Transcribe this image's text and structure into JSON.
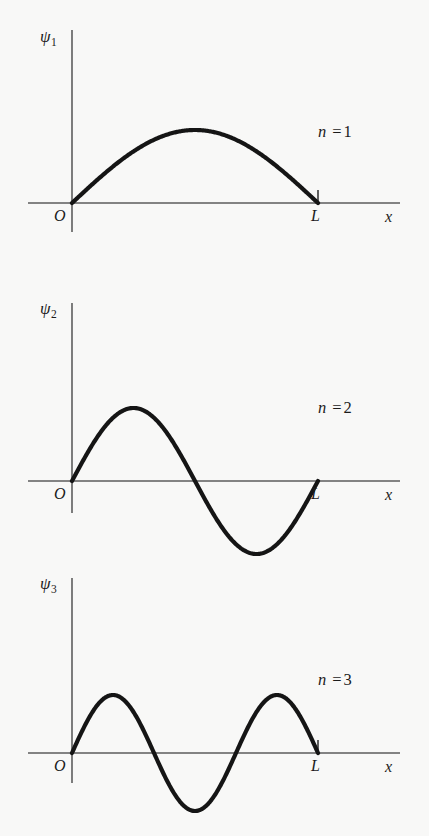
{
  "figure": {
    "background_color": "#f8f8f7",
    "curve_color": "#151515",
    "axis_color": "#5d5d5d",
    "axis_label_x": "x",
    "origin_label": "O",
    "end_label": "L"
  },
  "panels": [
    {
      "id": "panel-n1",
      "psi_symbol": "ψ",
      "psi_subscript": "1",
      "mode_var": "n",
      "mode_eq": "=",
      "mode_value": "1",
      "origin_label": "O",
      "end_label": "L",
      "axis_label_x": "x",
      "has_end_tick": true
    },
    {
      "id": "panel-n2",
      "psi_symbol": "ψ",
      "psi_subscript": "2",
      "mode_var": "n",
      "mode_eq": "=",
      "mode_value": "2",
      "origin_label": "O",
      "end_label": "L",
      "axis_label_x": "x",
      "has_end_tick": false
    },
    {
      "id": "panel-n3",
      "psi_symbol": "ψ",
      "psi_subscript": "3",
      "mode_var": "n",
      "mode_eq": "=",
      "mode_value": "3",
      "origin_label": "O",
      "end_label": "L",
      "axis_label_x": "x",
      "has_end_tick": true
    }
  ],
  "chart_data": [
    {
      "type": "line",
      "title": "",
      "xlabel": "x",
      "ylabel": "ψ₁",
      "annotation": "n = 1",
      "quantum_number": 1,
      "function": "sin(n*pi*x/L)",
      "x_domain": [
        0,
        1
      ],
      "x_tick_labels": [
        "O",
        "L"
      ],
      "ylim": [
        -1,
        1
      ],
      "grid": false,
      "legend": "none",
      "x": [
        0,
        0.05,
        0.1,
        0.15,
        0.2,
        0.25,
        0.3,
        0.35,
        0.4,
        0.45,
        0.5,
        0.55,
        0.6,
        0.65,
        0.7,
        0.75,
        0.8,
        0.85,
        0.9,
        0.95,
        1
      ],
      "y": [
        0,
        0.156,
        0.309,
        0.454,
        0.588,
        0.707,
        0.809,
        0.891,
        0.951,
        0.988,
        1,
        0.988,
        0.951,
        0.891,
        0.809,
        0.707,
        0.588,
        0.454,
        0.309,
        0.156,
        0
      ]
    },
    {
      "type": "line",
      "title": "",
      "xlabel": "x",
      "ylabel": "ψ₂",
      "annotation": "n = 2",
      "quantum_number": 2,
      "function": "sin(n*pi*x/L)",
      "x_domain": [
        0,
        1
      ],
      "x_tick_labels": [
        "O",
        "L"
      ],
      "ylim": [
        -1,
        1
      ],
      "grid": false,
      "legend": "none",
      "x": [
        0,
        0.05,
        0.1,
        0.15,
        0.2,
        0.25,
        0.3,
        0.35,
        0.4,
        0.45,
        0.5,
        0.55,
        0.6,
        0.65,
        0.7,
        0.75,
        0.8,
        0.85,
        0.9,
        0.95,
        1
      ],
      "y": [
        0,
        0.309,
        0.588,
        0.809,
        0.951,
        1,
        0.951,
        0.809,
        0.588,
        0.309,
        0,
        -0.309,
        -0.588,
        -0.809,
        -0.951,
        -1,
        -0.951,
        -0.809,
        -0.588,
        -0.309,
        0
      ]
    },
    {
      "type": "line",
      "title": "",
      "xlabel": "x",
      "ylabel": "ψ₃",
      "annotation": "n = 3",
      "quantum_number": 3,
      "function": "sin(n*pi*x/L)",
      "x_domain": [
        0,
        1
      ],
      "x_tick_labels": [
        "O",
        "L"
      ],
      "ylim": [
        -1,
        1
      ],
      "grid": false,
      "legend": "none",
      "x": [
        0,
        0.05,
        0.1,
        0.15,
        0.2,
        0.25,
        0.3,
        0.35,
        0.4,
        0.45,
        0.5,
        0.55,
        0.6,
        0.65,
        0.7,
        0.75,
        0.8,
        0.85,
        0.9,
        0.95,
        1
      ],
      "y": [
        0,
        0.454,
        0.809,
        0.988,
        0.951,
        0.707,
        0.309,
        -0.156,
        -0.588,
        -0.891,
        -1,
        -0.891,
        -0.588,
        -0.156,
        0.309,
        0.707,
        0.951,
        0.988,
        0.809,
        0.454,
        0
      ]
    }
  ],
  "geometry": {
    "panel_tops": [
      0,
      278,
      550
    ],
    "panel_height": 278,
    "y_axis_x": 72,
    "axis_baseline_y": 203,
    "y_axis_top_y": 30,
    "y_axis_bottom_y": 232,
    "x_axis_left_x": 28,
    "x_axis_right_x": 400,
    "box_end_x": 318,
    "amplitude_px": 73,
    "end_tick_height": 13
  }
}
